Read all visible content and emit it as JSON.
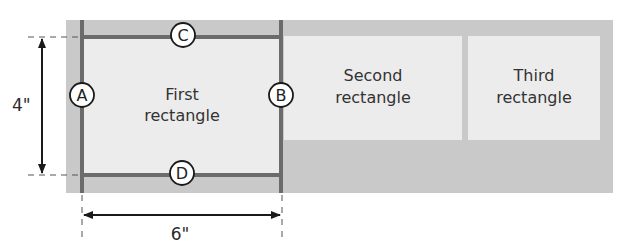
{
  "diagram": {
    "colors": {
      "background_gray": "#c9c9c9",
      "rect_fill": "#ececec",
      "frame_line": "#6b6b6b",
      "arrow": "#1a1a1a",
      "circle_fill": "#ffffff"
    },
    "rectangles": [
      {
        "id": "first",
        "line1": "First",
        "line2": "rectangle"
      },
      {
        "id": "second",
        "line1": "Second",
        "line2": "rectangle"
      },
      {
        "id": "third",
        "line1": "Third",
        "line2": "rectangle"
      }
    ],
    "markers": {
      "A": "A",
      "B": "B",
      "C": "C",
      "D": "D"
    },
    "dimensions": {
      "height": "4\"",
      "width": "6\""
    }
  }
}
